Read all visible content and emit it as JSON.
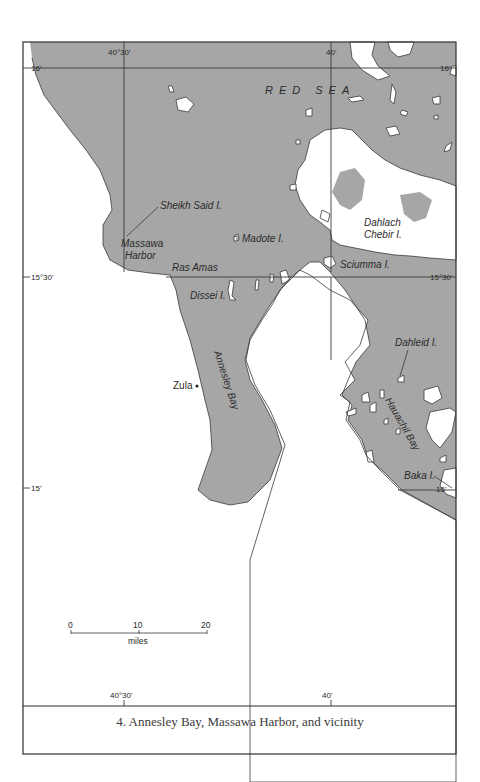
{
  "map": {
    "caption": "4. Annesley Bay, Massawa Harbor, and vicinity",
    "colors": {
      "sea": "#a6a6a6",
      "land": "#ffffff",
      "ink": "#2a2a2a"
    },
    "longitude_ticks_top": [
      "40°30'",
      "40'"
    ],
    "longitude_ticks_bottom": [
      "40°30'",
      "40'"
    ],
    "latitude_ticks_left": [
      "16'",
      "15°30'",
      "15'"
    ],
    "latitude_ticks_right": [
      "16'",
      "15°30'",
      "15'"
    ],
    "sea_label": "RED SEA",
    "place_labels": {
      "sheikh_said": "Sheikh Said I.",
      "massawa_1": "Massawa",
      "massawa_2": "Harbor",
      "madote": "Madote I.",
      "ras_amas": "Ras Amas",
      "dissei": "Dissei I.",
      "dahlach_1": "Dahlach",
      "dahlach_2": "Chebir I.",
      "sciumma": "Sciumma I.",
      "dahleid": "Dahleid I.",
      "annesley_bay": "Annesley Bay",
      "hauachil_bay": "Hauachil Bay",
      "baka": "Baka I.",
      "zula": "Zula"
    },
    "scale_bar": {
      "ticks": [
        "0",
        "10",
        "20"
      ],
      "unit": "miles"
    }
  }
}
